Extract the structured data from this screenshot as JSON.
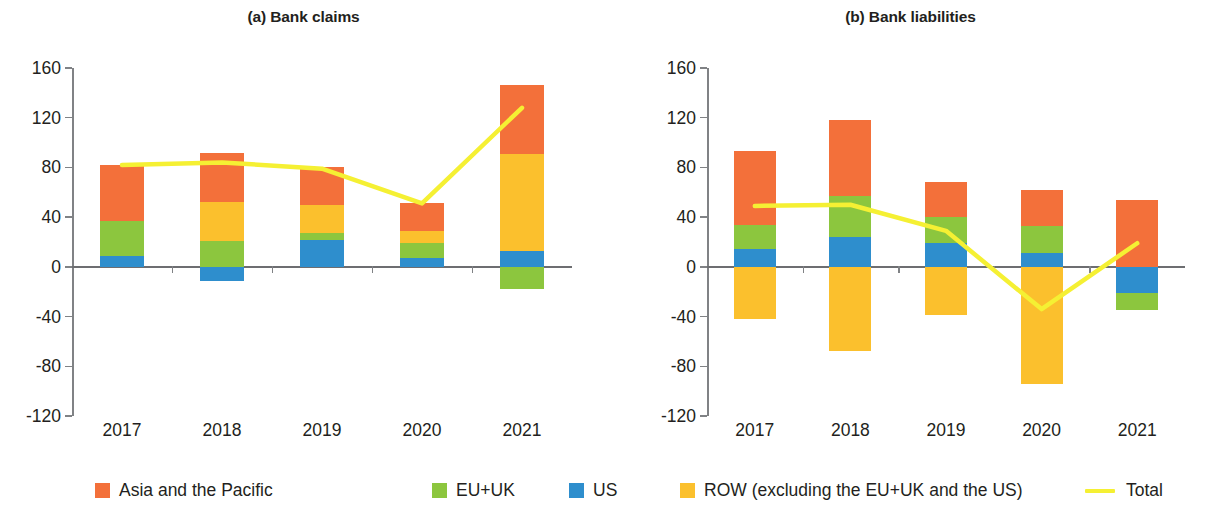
{
  "figure": {
    "panels": [
      {
        "id": "a",
        "title": "(a) Bank claims"
      },
      {
        "id": "b",
        "title": "(b) Bank liabilities"
      }
    ]
  },
  "legend": {
    "items": [
      {
        "label": "Asia and the Pacific",
        "color": "#F3703A",
        "marker": "square"
      },
      {
        "label": "EU+UK",
        "color": "#8CC63E",
        "marker": "square"
      },
      {
        "label": "US",
        "color": "#2E8ECD",
        "marker": "square"
      },
      {
        "label": "ROW (excluding the EU+UK and the US)",
        "color": "#FBC02D",
        "marker": "square"
      },
      {
        "label": "Total",
        "color": "#F5F033",
        "marker": "line"
      }
    ]
  },
  "chart_data": [
    {
      "type": "bar",
      "stacked": true,
      "title": "(a) Bank claims",
      "xlabel": "",
      "ylabel": "",
      "categories": [
        "2017",
        "2018",
        "2019",
        "2020",
        "2021"
      ],
      "ylim": [
        -120,
        160
      ],
      "yticks": [
        -120,
        -80,
        -40,
        0,
        40,
        80,
        120,
        160
      ],
      "ytick_labels": [
        "-120",
        "-80",
        "-40",
        "0",
        "40",
        "80",
        "120",
        "160"
      ],
      "grid": false,
      "legend_position": "bottom",
      "series": [
        {
          "name": "US",
          "color": "#2E8ECD",
          "values": [
            9,
            -11,
            22,
            7,
            13
          ]
        },
        {
          "name": "EU+UK",
          "color": "#8CC63E",
          "values": [
            28,
            21,
            5,
            12,
            -18
          ]
        },
        {
          "name": "ROW (excluding the EU+UK and the US)",
          "color": "#FBC02D",
          "values": [
            0,
            31,
            23,
            10,
            78
          ]
        },
        {
          "name": "Asia and the Pacific",
          "color": "#F3703A",
          "values": [
            45,
            40,
            30,
            22,
            55
          ]
        }
      ],
      "line_series": {
        "name": "Total",
        "color": "#F5F033",
        "values": [
          82,
          84,
          79,
          51,
          128
        ]
      }
    },
    {
      "type": "bar",
      "stacked": true,
      "title": "(b) Bank liabilities",
      "xlabel": "",
      "ylabel": "",
      "categories": [
        "2017",
        "2018",
        "2019",
        "2020",
        "2021"
      ],
      "ylim": [
        -120,
        160
      ],
      "yticks": [
        -120,
        -80,
        -40,
        0,
        40,
        80,
        120,
        160
      ],
      "ytick_labels": [
        "-120",
        "-80",
        "-40",
        "0",
        "40",
        "80",
        "120",
        "160"
      ],
      "grid": false,
      "legend_position": "bottom",
      "series": [
        {
          "name": "US",
          "color": "#2E8ECD",
          "values": [
            14,
            24,
            19,
            11,
            -21
          ]
        },
        {
          "name": "EU+UK",
          "color": "#8CC63E",
          "values": [
            20,
            33,
            21,
            22,
            -14
          ]
        },
        {
          "name": "ROW (excluding the EU+UK and the US)",
          "color": "#FBC02D",
          "values": [
            -42,
            -68,
            -39,
            -94,
            0
          ]
        },
        {
          "name": "Asia and the Pacific",
          "color": "#F3703A",
          "values": [
            59,
            61,
            28,
            29,
            54
          ]
        }
      ],
      "line_series": {
        "name": "Total",
        "color": "#F5F033",
        "values": [
          49,
          50,
          29,
          -34,
          19
        ]
      }
    }
  ]
}
